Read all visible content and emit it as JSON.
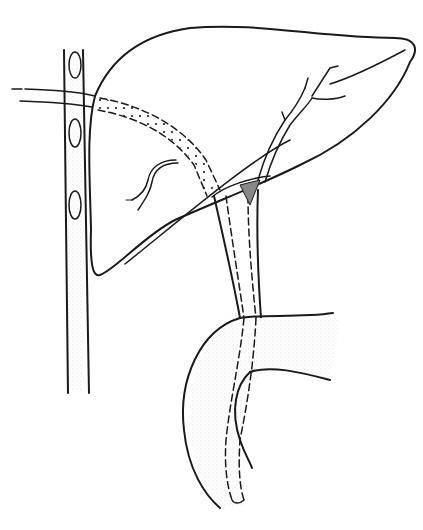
{
  "figure": {
    "kind": "anatomical line illustration",
    "description": "Liver with intrahepatic bile duct branches, common bile duct and duodenum; a catheter enters from the left through the rib/drain column and traverses the liver into the bile duct and duodenum",
    "parts": {
      "rib_column": "vertical stippled column with three oval openings",
      "catheter": "tube entering from left, stippled segment inside liver, dashed course down the common bile duct into duodenum",
      "liver": "liver outline with lobe fissure line",
      "left_duct_branch": "branched intrahepatic duct (left)",
      "right_duct_branch": "branched intrahepatic duct (right)",
      "common_bile_duct": "duct descending to duodenum",
      "gallbladder_junction": "shaded triangular region at duct junction",
      "duodenum": "C-shaped duodenal loop at bottom"
    },
    "colors": {
      "ink": "#1a1a1a",
      "stipple": "#bdbdbd",
      "background": "#ffffff"
    }
  }
}
